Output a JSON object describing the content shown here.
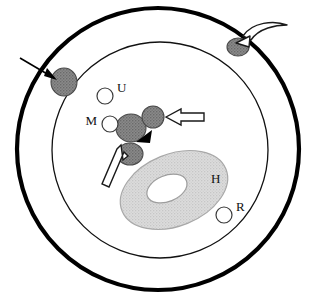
{
  "figure": {
    "name": "cell-schematic",
    "background_color": "#ffffff",
    "canvas": {
      "width": 316,
      "height": 295
    }
  },
  "colors": {
    "outline": "#000000",
    "vesicle_fill": "#7d7d7d",
    "vesicle_stroke": "#4a4a4a",
    "organelle_fill": "#d6d6d6",
    "organelle_stroke": "#9a9a9a",
    "open_circle_fill": "#ffffff",
    "open_circle_stroke": "#3a3a3a",
    "hollow_arrow_fill": "#ffffff",
    "hollow_arrow_stroke": "#1a1a1a",
    "label_color": "#111111"
  },
  "cell": {
    "outer_membrane": {
      "name": "outer-membrane",
      "cx": 158,
      "cy": 149,
      "r": 141,
      "stroke_width": 4.2
    },
    "inner_membrane": {
      "name": "inner-membrane",
      "cx": 160,
      "cy": 150,
      "r": 108,
      "stroke_width": 1.3
    }
  },
  "organelle": {
    "name": "nucleus-H",
    "label": "H",
    "label_x": 211,
    "label_y": 180,
    "cx": 174,
    "cy": 190,
    "rx": 56,
    "ry": 36,
    "rotation": -22,
    "hole_cx": 168,
    "hole_cy": 186,
    "hole_rx": 21,
    "hole_ry": 13
  },
  "vesicles": [
    {
      "name": "vesicle-membrane-left",
      "cx": 64,
      "cy": 82,
      "rx": 13,
      "ry": 14
    },
    {
      "name": "vesicle-membrane-top",
      "cx": 238,
      "cy": 47,
      "rx": 11,
      "ry": 9
    },
    {
      "name": "vesicle-cluster-large",
      "cx": 131,
      "cy": 128,
      "rx": 15,
      "ry": 14
    },
    {
      "name": "vesicle-cluster-upper",
      "cx": 153,
      "cy": 117,
      "rx": 11,
      "ry": 11
    },
    {
      "name": "vesicle-cluster-lower",
      "cx": 130,
      "cy": 154,
      "rx": 13,
      "ry": 11
    }
  ],
  "open_circles": [
    {
      "name": "open-circle-U",
      "label": "U",
      "cx": 105,
      "cy": 96,
      "r": 8,
      "label_x": 117,
      "label_y": 89
    },
    {
      "name": "open-circle-M",
      "label": "M",
      "cx": 110,
      "cy": 124,
      "r": 8,
      "label_x": 97,
      "label_y": 122,
      "label_anchor": "end"
    },
    {
      "name": "open-circle-R",
      "label": "R",
      "cx": 224,
      "cy": 215,
      "r": 8,
      "label_x": 236,
      "label_y": 208
    }
  ],
  "arrows": {
    "solid_line_arrow": {
      "name": "solid-arrow-left-entry",
      "description": "thin solid arrow pointing down-right at outer membrane",
      "x1": 20,
      "y1": 58,
      "x2": 56,
      "y2": 79
    },
    "curved_hollow_arrow": {
      "name": "curved-hollow-arrow-top-right",
      "description": "curved open arrow pointing down-left to membrane vesicle"
    },
    "hollow_arrow_right": {
      "name": "hollow-arrow-right",
      "description": "straight open arrow pointing left at upper cluster vesicle"
    },
    "hollow_arrow_lower_left": {
      "name": "hollow-arrow-lower-left",
      "description": "diagonal open arrow pointing up-right at lower cluster vesicle"
    },
    "solid_arrowhead": {
      "name": "solid-arrowhead-center",
      "description": "small filled black triangle pointing down-left",
      "x": 143,
      "y": 136
    }
  },
  "labels": {
    "U": "U",
    "M": "M",
    "H": "H",
    "R": "R"
  }
}
